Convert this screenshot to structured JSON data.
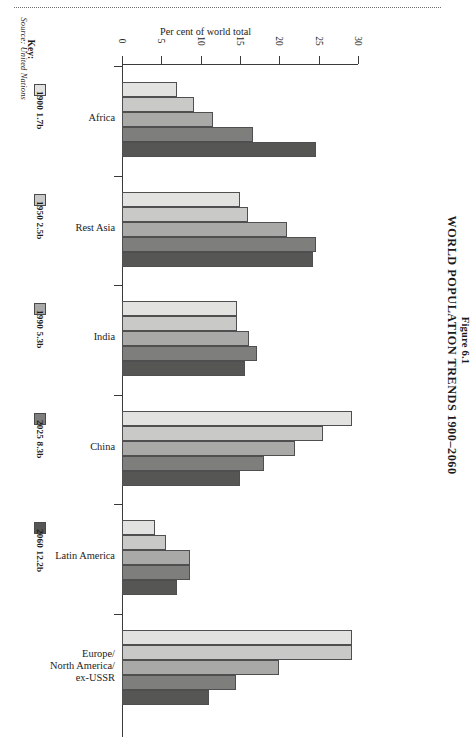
{
  "figure": {
    "number": "Figure 6.1",
    "title": "WORLD POPULATION TRENDS 1900–2060"
  },
  "source": {
    "text": "Source: United Nations"
  },
  "key": {
    "label": "Key:",
    "items": [
      {
        "label": "1900 1.7b",
        "color": "#e2e2e0"
      },
      {
        "label": "1950 2.5b",
        "color": "#c9c9c7"
      },
      {
        "label": "1990 5.3b",
        "color": "#a9a9a7"
      },
      {
        "label": "2025 8.3b",
        "color": "#7e7e7c"
      },
      {
        "label": "2060 12.2b",
        "color": "#565654"
      }
    ]
  },
  "chart_data": {
    "type": "bar",
    "orientation": "horizontal",
    "title": "WORLD POPULATION TRENDS 1900–2060",
    "subtitle": "Figure 6.1",
    "xlabel": "Per cent of world total",
    "ylabel": "",
    "xlim": [
      0,
      30
    ],
    "xticks": [
      0,
      5,
      10,
      15,
      20,
      25,
      30
    ],
    "xtick_labels": [
      "0",
      "5",
      "10",
      "15",
      "20",
      "25",
      "30"
    ],
    "grid": false,
    "legend_position": "left",
    "categories": [
      "Africa",
      "Rest Asia",
      "India",
      "China",
      "Latin America",
      "Europe/\nNorth America/\nex-USSR"
    ],
    "category_labels": [
      [
        "Africa"
      ],
      [
        "Rest Asia"
      ],
      [
        "India"
      ],
      [
        "China"
      ],
      [
        "Latin America"
      ],
      [
        "Europe/",
        "North America/",
        "ex-USSR"
      ]
    ],
    "series": [
      {
        "name": "1900 1.7b",
        "color": "#e2e2e0",
        "values": [
          7.0,
          15.0,
          14.6,
          29.2,
          4.2,
          29.3
        ]
      },
      {
        "name": "1950 2.5b",
        "color": "#c9c9c7",
        "values": [
          9.2,
          16.0,
          14.6,
          25.6,
          5.6,
          29.3
        ]
      },
      {
        "name": "1990 5.3b",
        "color": "#a9a9a7",
        "values": [
          11.6,
          21.0,
          16.2,
          22.0,
          8.6,
          20.0
        ]
      },
      {
        "name": "2025 8.3b",
        "color": "#7e7e7c",
        "values": [
          16.6,
          24.6,
          17.2,
          18.0,
          8.6,
          14.5
        ]
      },
      {
        "name": "2060 12.2b",
        "color": "#565654",
        "values": [
          24.6,
          24.3,
          15.6,
          15.0,
          7.0,
          11.0
        ]
      }
    ]
  },
  "axis": {
    "title": "Per cent of world total"
  }
}
